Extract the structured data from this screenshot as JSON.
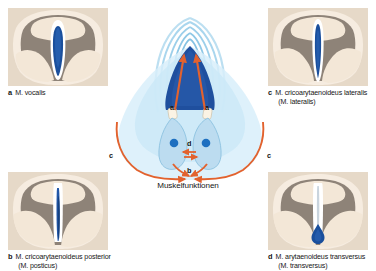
{
  "figure": {
    "center_label": "Muskelfunktionen",
    "markers": [
      {
        "id": "a-left",
        "label": "a"
      },
      {
        "id": "a-right",
        "label": "a"
      },
      {
        "id": "d",
        "label": "d"
      },
      {
        "id": "b",
        "label": "b"
      },
      {
        "id": "c-left",
        "label": "c"
      },
      {
        "id": "c-right",
        "label": "c"
      }
    ]
  },
  "panels": [
    {
      "id": "a",
      "index": "a",
      "title": "M. vocalis",
      "subtitle": "",
      "glottis": "wide-lens"
    },
    {
      "id": "b",
      "index": "b",
      "title": "M. cricoarytaenoideus posterior",
      "subtitle": "(M. posticus)",
      "glottis": "narrow-slit"
    },
    {
      "id": "c",
      "index": "c",
      "title": "M. cricoarytaenoideus lateralis",
      "subtitle": "(M. lateralis)",
      "glottis": "narrow-teardrop"
    },
    {
      "id": "d",
      "index": "d",
      "title": "M. arytaenoideus transversus",
      "subtitle": "(M. transversus)",
      "glottis": "slit-with-base-blob"
    }
  ],
  "colors": {
    "panel_background": "#e6d9c8",
    "mucosa_gray": "#8e8378",
    "cartilage_cream": "#f4e8d8",
    "glottis_blue": "#1a4f9c",
    "arrow_orange": "#e2622e",
    "schematic_light_blue": "#bfe0f0",
    "schematic_dark_blue": "#1f4f9e",
    "text": "#141414"
  }
}
